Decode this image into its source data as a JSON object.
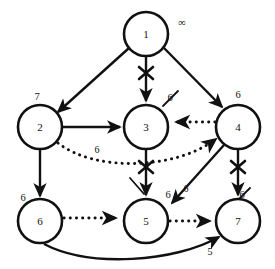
{
  "diagram": {
    "type": "graph",
    "colors": {
      "stroke": "#111111",
      "background": "#ffffff"
    },
    "nodes": [
      {
        "id": "n1",
        "label": "1",
        "dist": "∞",
        "cx": 146,
        "cy": 34,
        "r": 22,
        "dist_x": 182,
        "dist_y": 24
      },
      {
        "id": "n2",
        "label": "2",
        "dist": "7",
        "cx": 40,
        "cy": 127,
        "r": 22,
        "dist_x": 37,
        "dist_y": 98
      },
      {
        "id": "n3",
        "label": "3",
        "dist": "6",
        "cx": 146,
        "cy": 127,
        "r": 22,
        "dist_x": 170,
        "dist_y": 99
      },
      {
        "id": "n4",
        "label": "4",
        "dist": "6",
        "cx": 238,
        "cy": 127,
        "r": 22,
        "dist_x": 238,
        "dist_y": 96
      },
      {
        "id": "n6",
        "label": "6",
        "dist": "6",
        "cx": 40,
        "cy": 221,
        "r": 22,
        "dist_x": 23,
        "dist_y": 199
      },
      {
        "id": "n5",
        "label": "5",
        "dist": "6",
        "cx": 146,
        "cy": 221,
        "r": 22,
        "dist_x": 168,
        "dist_y": 196
      },
      {
        "id": "n7",
        "label": "7",
        "dist": "6",
        "cx": 238,
        "cy": 221,
        "r": 22,
        "dist_x": 242,
        "dist_y": 196
      }
    ],
    "crossed_labels": [
      {
        "for": "n3",
        "text": "6"
      },
      {
        "for": "n5",
        "text": "6"
      },
      {
        "for": "n7",
        "text": "6"
      }
    ],
    "edges": [
      {
        "from": "1",
        "to": "2",
        "style": "solid",
        "weight": "",
        "crossed": false
      },
      {
        "from": "1",
        "to": "3",
        "style": "solid",
        "weight": "",
        "crossed": true
      },
      {
        "from": "1",
        "to": "4",
        "style": "solid",
        "weight": "",
        "crossed": false
      },
      {
        "from": "2",
        "to": "3",
        "style": "solid",
        "weight": "6",
        "crossed": false
      },
      {
        "from": "2",
        "to": "6",
        "style": "solid",
        "weight": "",
        "crossed": false
      },
      {
        "from": "2",
        "to": "4",
        "style": "dotted",
        "weight": "",
        "crossed": false
      },
      {
        "from": "4",
        "to": "3",
        "style": "dotted",
        "weight": "",
        "crossed": false
      },
      {
        "from": "3",
        "to": "5",
        "style": "solid",
        "weight": "",
        "crossed": true
      },
      {
        "from": "4",
        "to": "5",
        "style": "solid",
        "weight": "6",
        "crossed": false
      },
      {
        "from": "4",
        "to": "7",
        "style": "solid",
        "weight": "",
        "crossed": true
      },
      {
        "from": "6",
        "to": "5",
        "style": "dotted",
        "weight": "",
        "crossed": false
      },
      {
        "from": "5",
        "to": "7",
        "style": "dotted",
        "weight": "",
        "crossed": false
      },
      {
        "from": "6",
        "to": "7",
        "style": "solid",
        "weight": "5",
        "crossed": false
      }
    ],
    "edge_labels": [
      {
        "text": "6",
        "x": 97,
        "y": 151
      },
      {
        "text": "6",
        "x": 186,
        "y": 190
      },
      {
        "text": "5",
        "x": 210,
        "y": 253
      }
    ]
  }
}
